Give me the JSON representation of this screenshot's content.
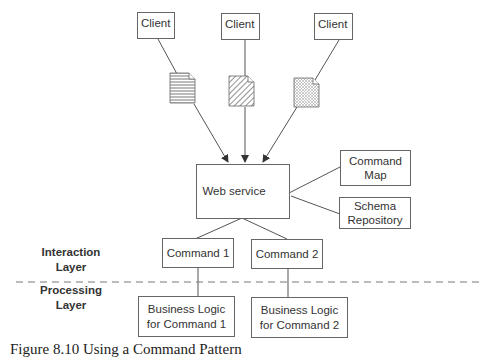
{
  "diagram": {
    "clients": [
      {
        "label": "Client"
      },
      {
        "label": "Client"
      },
      {
        "label": "Client"
      }
    ],
    "documents": [
      {
        "pattern": "horizontal-lines"
      },
      {
        "pattern": "diagonal-hatch"
      },
      {
        "pattern": "crosshatch"
      }
    ],
    "web_service": {
      "label": "Web service"
    },
    "command_map": {
      "line1": "Command",
      "line2": "Map"
    },
    "schema_repository": {
      "line1": "Schema",
      "line2": "Repository"
    },
    "commands": [
      {
        "label": "Command 1"
      },
      {
        "label": "Command 2"
      }
    ],
    "business_logic": [
      {
        "line1": "Business Logic",
        "line2": "for Command 1"
      },
      {
        "line1": "Business Logic",
        "line2": "for Command 2"
      }
    ],
    "layers": {
      "interaction": {
        "line1": "Interaction",
        "line2": "Layer"
      },
      "processing": {
        "line1": "Processing",
        "line2": "Layer"
      }
    },
    "caption": "Figure 8.10  Using a Command Pattern"
  }
}
